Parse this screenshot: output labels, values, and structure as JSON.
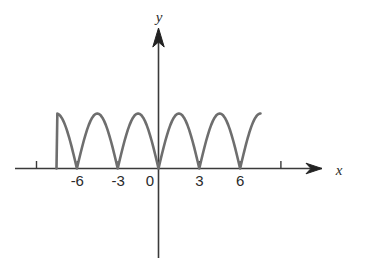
{
  "figure": {
    "background_color": "#ffffff",
    "axis_color": "#3a3a3a",
    "curve_color": "#6e6e6e",
    "label_color": "#2b2b2b",
    "x_axis_name": "x",
    "y_axis_name": "y",
    "origin_label": "0"
  },
  "chart_data": {
    "type": "line",
    "title": "",
    "xlabel": "x",
    "ylabel": "y",
    "grid": false,
    "legend": null,
    "xlim": [
      -9.2,
      9.6
    ],
    "ylim": [
      -3.4,
      3.2
    ],
    "xticks": [
      -6,
      -3,
      0,
      3,
      6
    ],
    "xtick_labels": [
      "-6",
      "-3",
      "0",
      "3",
      "6"
    ],
    "yticks": [],
    "ytick_labels": [],
    "series": [
      {
        "name": "y = |sin(pi*x/3)|",
        "description": "Six positive arches (absolute-value sine shape), period 3, amplitude 1, touching the x-axis at every multiple of 3",
        "period": 3,
        "amplitude": 1,
        "x_start": -7.5,
        "x_end": 7.5,
        "zeros": [
          -7.5,
          -6,
          -3,
          0,
          3,
          6,
          7.5
        ],
        "arch_peaks": [
          {
            "x": -6.75,
            "y": 1
          },
          {
            "x": -4.5,
            "y": 1
          },
          {
            "x": -1.5,
            "y": 1
          },
          {
            "x": 1.5,
            "y": 1
          },
          {
            "x": 4.5,
            "y": 1
          },
          {
            "x": 6.75,
            "y": 1
          }
        ],
        "x": [
          -7.5,
          -7.2,
          -6.9,
          -6.6,
          -6.3,
          -6.0,
          -5.7,
          -5.4,
          -5.1,
          -4.8,
          -4.5,
          -4.2,
          -3.9,
          -3.6,
          -3.3,
          -3.0,
          -2.7,
          -2.4,
          -2.1,
          -1.8,
          -1.5,
          -1.2,
          -0.9,
          -0.6,
          -0.3,
          0.0,
          0.3,
          0.6,
          0.9,
          1.2,
          1.5,
          1.8,
          2.1,
          2.4,
          2.7,
          3.0,
          3.3,
          3.6,
          3.9,
          4.2,
          4.5,
          4.8,
          5.1,
          5.4,
          5.7,
          6.0,
          6.3,
          6.6,
          6.9,
          7.2,
          7.5
        ],
        "y": [
          0.0,
          0.31,
          0.59,
          0.81,
          0.95,
          1.0,
          0.95,
          0.81,
          0.59,
          0.31,
          1.0,
          0.31,
          0.59,
          0.81,
          0.95,
          0.0,
          0.31,
          0.59,
          0.81,
          0.95,
          1.0,
          0.95,
          0.81,
          0.59,
          0.31,
          0.0,
          0.31,
          0.59,
          0.81,
          0.95,
          1.0,
          0.95,
          0.81,
          0.59,
          0.31,
          0.0,
          0.31,
          0.59,
          0.81,
          0.95,
          1.0,
          0.95,
          0.81,
          0.59,
          0.31,
          0.0,
          0.31,
          0.59,
          0.81,
          0.95,
          1.0
        ]
      }
    ]
  }
}
